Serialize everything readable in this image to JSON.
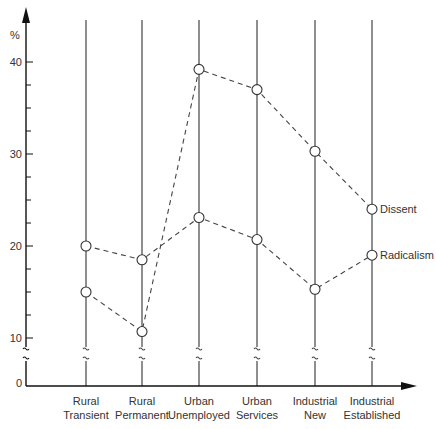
{
  "chart_data": {
    "type": "line",
    "title": "",
    "xlabel": "",
    "ylabel": "%",
    "categories": [
      "Rural Transient",
      "Rural Permanent",
      "Urban Unemployed",
      "Urban Services",
      "Industrial New",
      "Industrial Established"
    ],
    "category_lines": [
      [
        "Rural",
        "Transient"
      ],
      [
        "Rural",
        "Permanent"
      ],
      [
        "Urban",
        "Unemployed"
      ],
      [
        "Urban",
        "Services"
      ],
      [
        "Industrial",
        "New"
      ],
      [
        "Industrial",
        "Established"
      ]
    ],
    "series": [
      {
        "name": "Dissent",
        "values": [
          15.0,
          10.7,
          39.2,
          37.0,
          30.3,
          24.0
        ],
        "style": "dashed",
        "marker": "open-circle"
      },
      {
        "name": "Radicalism",
        "values": [
          20.0,
          18.5,
          23.1,
          20.7,
          15.3,
          19.0
        ],
        "style": "dashed",
        "marker": "open-circle"
      }
    ],
    "y_ticks": [
      0,
      10,
      20,
      30,
      40
    ],
    "y_tick_labels": [
      "0",
      "10",
      "20",
      "30",
      "40"
    ],
    "y_minor_step": 2.5,
    "ylim": [
      0,
      42
    ],
    "axis_break": "between 0 and 10 (squiggle marks on each category line)",
    "legend": "inline labels at right end of each series",
    "grid": false,
    "colors": {
      "line": "#444444",
      "axis": "#111111",
      "marker_fill": "#ffffff"
    }
  },
  "caption_partial": "(caption cut off, illegible)"
}
